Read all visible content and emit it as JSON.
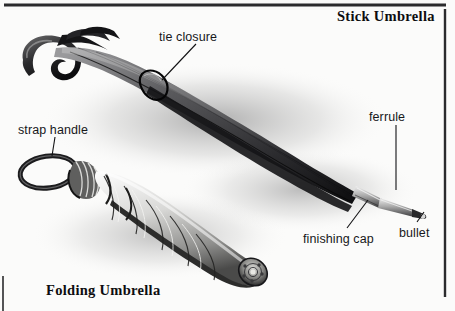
{
  "figure": {
    "kind": "pencil-illustration-diagram",
    "background_color": "#fbfbfa",
    "ink_color": "#17181a",
    "border_color": "#2b2b2d"
  },
  "titles": {
    "stick": "Stick Umbrella",
    "folding": "Folding Umbrella"
  },
  "callouts": [
    {
      "id": "tie-closure",
      "label": "tie closure"
    },
    {
      "id": "strap-handle",
      "label": "strap handle"
    },
    {
      "id": "ferrule",
      "label": "ferrule"
    },
    {
      "id": "finishing-cap",
      "label": "finishing cap"
    },
    {
      "id": "bullet",
      "label": "bullet"
    }
  ]
}
